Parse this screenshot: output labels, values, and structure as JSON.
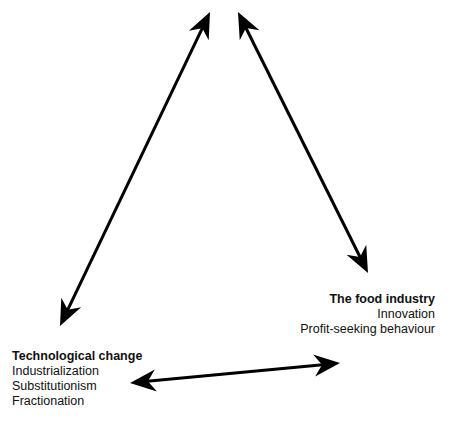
{
  "nodes": {
    "food_industry": {
      "title": "The food industry",
      "items": [
        "Innovation",
        "Profit-seeking behaviour"
      ]
    },
    "technological_change": {
      "title": "Technological change",
      "items": [
        "Industrialization",
        "Substitutionism",
        "Fractionation"
      ]
    }
  },
  "arrows": [
    {
      "name": "top-to-technological-change",
      "from": [
        210,
        12
      ],
      "to": [
        60,
        326
      ],
      "double_headed": true
    },
    {
      "name": "top-to-food-industry",
      "from": [
        238,
        12
      ],
      "to": [
        368,
        273
      ],
      "double_headed": true
    },
    {
      "name": "technological-change-to-food-industry",
      "from": [
        130,
        383
      ],
      "to": [
        340,
        363
      ],
      "double_headed": true
    }
  ],
  "colors": {
    "arrow": "#000000",
    "text": "#111111",
    "background": "#ffffff"
  }
}
